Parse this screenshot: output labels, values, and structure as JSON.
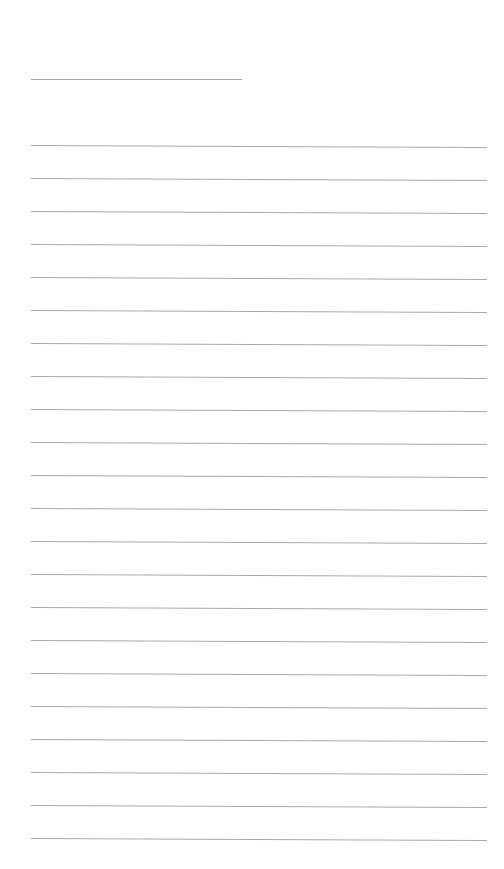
{
  "page": {
    "type": "lined-paper",
    "background": "#ffffff",
    "rule_color": "#a8a8a8"
  },
  "header_line": {
    "x1": 31,
    "x2": 242,
    "y": 79
  },
  "lines": {
    "x1": 31,
    "x2": 487,
    "first_y": 145,
    "spacing": 33,
    "count": 22,
    "slope_px": 2
  }
}
